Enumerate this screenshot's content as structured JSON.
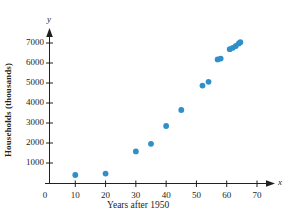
{
  "chart_data": {
    "type": "scatter",
    "title": "",
    "xlabel": "Years after 1950",
    "ylabel": "Households (thousands)",
    "x_axis_name": "x",
    "y_axis_name": "y",
    "xlim": [
      0,
      74
    ],
    "ylim": [
      0,
      7600
    ],
    "grid": false,
    "legend": false,
    "marker_color": "#2e8fc9",
    "axis_color": "#231f20",
    "xticks": [
      0,
      10,
      20,
      30,
      40,
      50,
      60,
      70
    ],
    "xtick_labels": [
      "0",
      "10",
      "20",
      "30",
      "40",
      "50",
      "60",
      "70"
    ],
    "yticks": [
      1000,
      2000,
      3000,
      4000,
      5000,
      6000,
      7000
    ],
    "ytick_labels": [
      "1000",
      "2000",
      "3000",
      "4000",
      "5000",
      "6000",
      "7000"
    ],
    "points": [
      {
        "x": 10,
        "y": 400
      },
      {
        "x": 20,
        "y": 470
      },
      {
        "x": 30,
        "y": 1580
      },
      {
        "x": 35,
        "y": 1960
      },
      {
        "x": 40,
        "y": 2850
      },
      {
        "x": 45,
        "y": 3650
      },
      {
        "x": 52,
        "y": 4870
      },
      {
        "x": 54,
        "y": 5060
      },
      {
        "x": 57,
        "y": 6180
      },
      {
        "x": 58,
        "y": 6220
      },
      {
        "x": 61,
        "y": 6690
      },
      {
        "x": 62,
        "y": 6760
      },
      {
        "x": 63,
        "y": 6850
      },
      {
        "x": 64,
        "y": 6980
      },
      {
        "x": 64.5,
        "y": 7040
      }
    ]
  }
}
